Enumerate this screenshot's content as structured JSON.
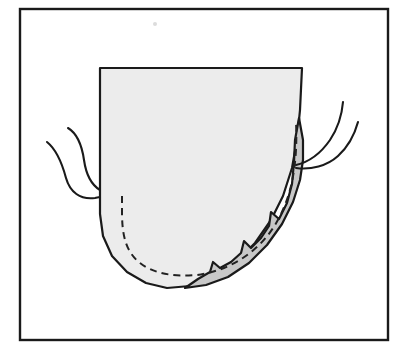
{
  "figure": {
    "domain": "Diagram",
    "kind": "anatomical-line-diagram",
    "caption": "",
    "width": 409,
    "height": 351,
    "background_color": "#ffffff"
  },
  "frame": {
    "name": "outer-border",
    "x": 20,
    "y": 9,
    "width": 368,
    "height": 331,
    "stroke_color": "#1a1a1a",
    "stroke_width": 2.4,
    "fill_color": "#ffffff"
  },
  "colors": {
    "ink": "#1a1a1a",
    "body_fill": "#ececec",
    "lesion_fill": "#c8c8c8",
    "dashed_stroke": "#222222",
    "white": "#ffffff"
  },
  "shapes": {
    "body": {
      "label": "main-body-outline",
      "description": "U-shaped organ cross-section, flat top, vertical sides, rounded bottom",
      "fill": "#ececec",
      "stroke": "#1a1a1a",
      "stroke_width": 2.2,
      "path": "M 100 68 L 302 68 L 300 110 L 297 140 L 292 168 L 283 196 L 271 220 L 255 243 L 236 262 L 214 277 L 190 286 L 167 288 L 146 283 L 127 272 L 112 256 L 103 236 L 100 214 Z"
    },
    "lesion": {
      "label": "shaded-lesion-wedge",
      "description": "Crescent shaded band along lower-right margin with three sawtooth notches on its inner edge",
      "fill": "#c8c8c8",
      "stroke": "#1a1a1a",
      "stroke_width": 2.2,
      "path": "M 299 118 L 303 140 L 303 160 L 300 180 L 293 202 L 282 224 L 267 245 L 249 263 L 228 277 L 206 285 L 185 288 L 198 279 L 210 272 L 213 262 L 220 268 L 231 262 L 241 253 L 244 241 L 251 248 L 261 238 L 269 226 L 271 212 L 279 219 L 287 203 L 292 184 L 294 162 L 295 140 Z"
    },
    "dashed_inner": {
      "label": "dashed-internal-boundary",
      "description": "Dashed line tracing inner margin from left attachment, around the bottom, and up the right shaded band",
      "stroke": "#222222",
      "stroke_width": 2.0,
      "dash_array": "7 5",
      "path": "M 122 196 L 122 212 C 122 236 126 252 140 263 C 154 274 175 277 197 275 C 220 272 241 262 258 246 C 274 231 285 210 291 186 C 296 165 297 142 296 122"
    }
  },
  "tendrils": {
    "label": "tendril-curves",
    "stroke": "#1a1a1a",
    "stroke_width": 2.1,
    "items": [
      {
        "name": "tendril-left-outer",
        "side": "left",
        "path": "M 47 142 C 57 150 62 163 66 178 C 70 192 80 200 95 198 C 106 196 112 194 122 196"
      },
      {
        "name": "tendril-left-inner",
        "side": "left",
        "path": "M 68 128 C 78 134 82 146 84 160 C 86 174 90 184 100 190"
      },
      {
        "name": "tendril-right-inner",
        "side": "right",
        "path": "M 296 165 C 309 162 321 153 330 140 C 338 128 342 114 343 102"
      },
      {
        "name": "tendril-right-outer",
        "side": "right",
        "path": "M 296 168 C 311 170 327 166 338 156 C 349 146 355 133 358 122"
      }
    ]
  },
  "annotations": {
    "speck": {
      "name": "page-speck",
      "x": 155,
      "y": 24,
      "radius": 2,
      "color": "#dcdcdc"
    }
  }
}
